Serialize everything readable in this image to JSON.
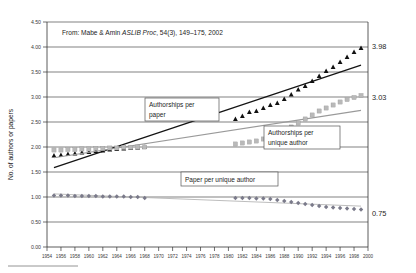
{
  "chart_data": {
    "type": "scatter",
    "title": "",
    "source_note": {
      "prefix": "From:  Mabe & Amin ",
      "italic": "ASLIB Proc",
      "suffix": ", 54(3), 149–175, 2002"
    },
    "xlabel": "",
    "ylabel": "No. of authors or papers",
    "xlim": [
      1954,
      2000
    ],
    "ylim": [
      0.0,
      4.5
    ],
    "grid": true,
    "legend_position": "inline-callouts",
    "yticks": [
      "0.00",
      "0.50",
      "1.00",
      "1.50",
      "2.00",
      "2.50",
      "3.00",
      "3.50",
      "4.00",
      "4.50"
    ],
    "xticks": [
      "1954",
      "1956",
      "1958",
      "1960",
      "1962",
      "1964",
      "1966",
      "1968",
      "1970",
      "1972",
      "1974",
      "1976",
      "1978",
      "1980",
      "1982",
      "1984",
      "1986",
      "1988",
      "1990",
      "1992",
      "1994",
      "1996",
      "1998",
      "2000"
    ],
    "series": [
      {
        "name": "Authorships per paper",
        "marker": "triangle",
        "color": "#111111",
        "end_label": "3.98",
        "x": [
          1955,
          1956,
          1957,
          1958,
          1959,
          1960,
          1961,
          1962,
          1963,
          1964,
          1965,
          1966,
          1967,
          1968,
          1981,
          1982,
          1983,
          1984,
          1985,
          1986,
          1987,
          1988,
          1989,
          1990,
          1991,
          1992,
          1993,
          1994,
          1995,
          1996,
          1997,
          1998,
          1999
        ],
        "y": [
          1.83,
          1.84,
          1.86,
          1.87,
          1.89,
          1.9,
          1.92,
          1.93,
          1.95,
          1.96,
          1.97,
          1.98,
          1.99,
          2.0,
          2.56,
          2.62,
          2.7,
          2.72,
          2.78,
          2.84,
          2.88,
          2.96,
          3.05,
          3.15,
          3.22,
          3.32,
          3.42,
          3.52,
          3.6,
          3.7,
          3.8,
          3.9,
          3.98
        ]
      },
      {
        "name": "Authorships per unique author",
        "marker": "square",
        "color": "#b9b9b9",
        "end_label": "3.03",
        "x": [
          1955,
          1956,
          1957,
          1958,
          1959,
          1960,
          1961,
          1962,
          1963,
          1964,
          1965,
          1966,
          1967,
          1968,
          1981,
          1982,
          1983,
          1984,
          1985,
          1986,
          1987,
          1988,
          1989,
          1990,
          1991,
          1992,
          1993,
          1994,
          1995,
          1996,
          1997,
          1998,
          1999
        ],
        "y": [
          1.94,
          1.94,
          1.95,
          1.95,
          1.96,
          1.96,
          1.97,
          1.97,
          1.98,
          1.98,
          1.99,
          1.99,
          2.0,
          2.0,
          2.06,
          2.08,
          2.1,
          2.12,
          2.16,
          2.2,
          2.26,
          2.32,
          2.4,
          2.48,
          2.56,
          2.64,
          2.72,
          2.78,
          2.84,
          2.9,
          2.95,
          2.99,
          3.03
        ]
      },
      {
        "name": "Paper per unique author",
        "marker": "diamond",
        "color": "#7a7a8a",
        "end_label": "0.75",
        "x": [
          1955,
          1956,
          1957,
          1958,
          1959,
          1960,
          1961,
          1962,
          1963,
          1964,
          1965,
          1966,
          1967,
          1968,
          1981,
          1982,
          1983,
          1984,
          1985,
          1986,
          1987,
          1988,
          1989,
          1990,
          1991,
          1992,
          1993,
          1994,
          1995,
          1996,
          1997,
          1998,
          1999
        ],
        "y": [
          1.03,
          1.03,
          1.03,
          1.02,
          1.02,
          1.02,
          1.02,
          1.01,
          1.01,
          1.01,
          1.01,
          1.0,
          1.0,
          0.98,
          0.98,
          0.98,
          0.98,
          0.97,
          0.97,
          0.96,
          0.94,
          0.92,
          0.9,
          0.88,
          0.86,
          0.84,
          0.82,
          0.8,
          0.79,
          0.78,
          0.77,
          0.76,
          0.75
        ]
      }
    ],
    "annotations": [
      {
        "id": "callout-authorships-per-paper",
        "lines": [
          "Authorships per",
          "paper"
        ]
      },
      {
        "id": "callout-authorships-per-unique-author",
        "lines": [
          "Authorships per",
          "unique author"
        ]
      },
      {
        "id": "callout-paper-per-unique-author",
        "lines": [
          "Paper per unique author"
        ]
      }
    ]
  }
}
